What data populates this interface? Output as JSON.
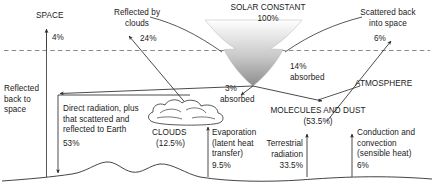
{
  "diagram": {
    "regions": {
      "space": "SPACE",
      "atmosphere": "ATMOSPHERE"
    },
    "incoming": {
      "source_label": "SOLAR CONSTANT",
      "source_value": "100%"
    },
    "labels": {
      "reflected_by_clouds": "Reflected by\nclouds",
      "reflected_by_clouds_value": "24%",
      "scattered_back": "Scattered back\ninto space",
      "scattered_back_value": "6%",
      "reflected_back_to_space": "Reflected\nback to\nspace",
      "reflected_back_to_space_value": "4%",
      "absorbed_atmosphere_value": "14%",
      "absorbed_atmosphere_word": "absorbed",
      "absorbed_clouds_value": "3%",
      "absorbed_clouds_word": "absorbed",
      "direct_radiation": "Direct radiation, plus\nthat scattered and\nreflected to Earth",
      "direct_radiation_value": "53%",
      "clouds": "CLOUDS",
      "clouds_value": "(12.5%)",
      "molecules_and_dust": "MOLECULES AND DUST",
      "molecules_and_dust_value": "(53.5%)",
      "evaporation": "Evaporation\n(latent heat\ntransfer)",
      "evaporation_value": "9.5%",
      "terrestrial_radiation": "Terrestrial\nradiation",
      "terrestrial_radiation_value": "33.5%",
      "conduction_convection": "Conduction and\nconvection\n(sensible heat)",
      "conduction_convection_value": "6%"
    },
    "colors": {
      "ink": "#1a1a1a",
      "line": "#3a3a3a",
      "dashed": "#6e6e6e",
      "beam_top": "#f2f2f2",
      "beam_bottom": "#8f8f8f"
    }
  }
}
